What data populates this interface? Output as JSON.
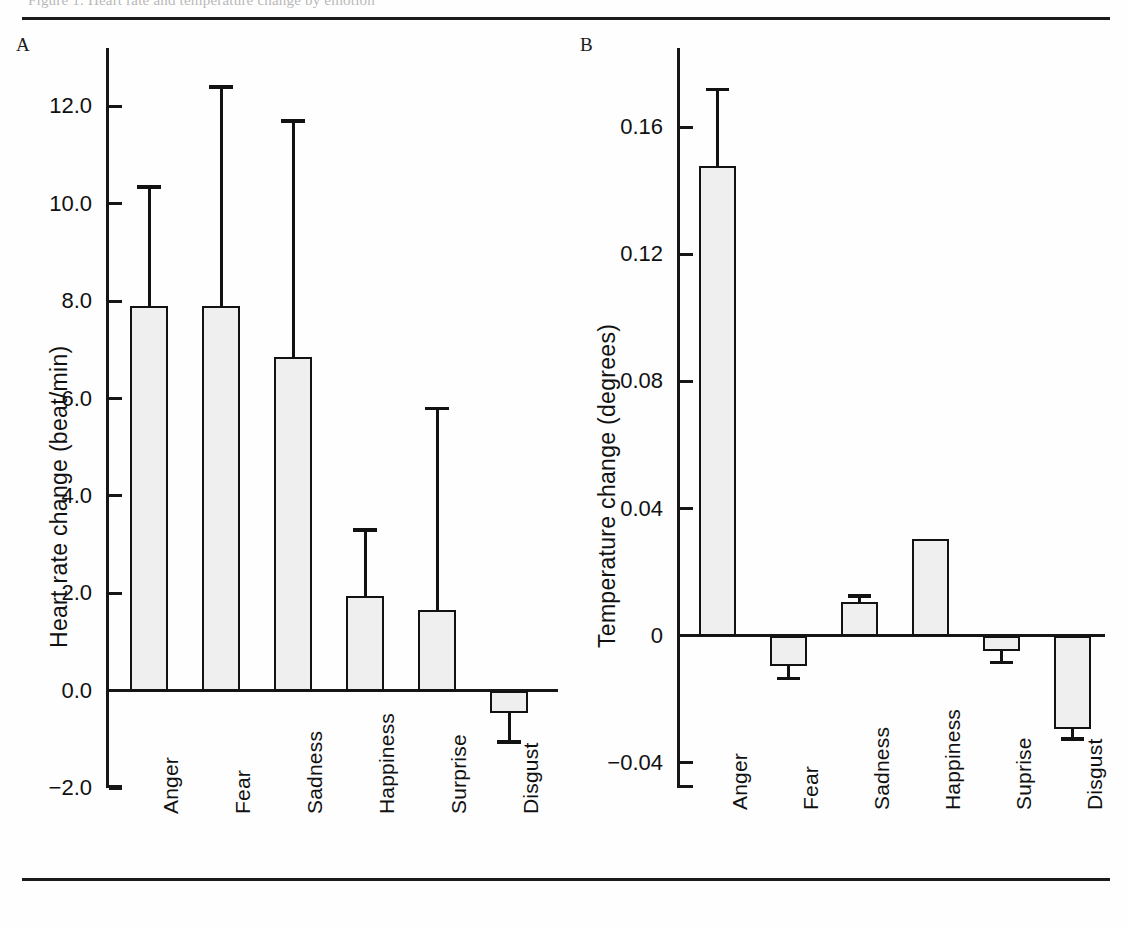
{
  "figure": {
    "caption_sliver": "Figure 1.  Heart rate and temperature change by emotion",
    "panels": [
      {
        "id": "A",
        "letter": "A"
      },
      {
        "id": "B",
        "letter": "B"
      }
    ]
  },
  "chart_data": [
    {
      "panel": "A",
      "type": "bar",
      "title": "",
      "xlabel": "",
      "ylabel": "Heart rate change (beat/min)",
      "ylim": [
        -2.0,
        13.2
      ],
      "yticks": [
        12.0,
        10.0,
        8.0,
        6.0,
        4.0,
        2.0,
        0.0,
        -2.0
      ],
      "ytick_labels": [
        "12.0",
        "10.0",
        "8.0",
        "6.0",
        "4.0",
        "2.0",
        "0.0",
        "−2.0"
      ],
      "grid": false,
      "legend": "none",
      "categories": [
        "Anger",
        "Fear",
        "Sadness",
        "Happiness",
        "Surprise",
        "Disgust"
      ],
      "values": [
        7.9,
        7.9,
        6.85,
        1.95,
        1.65,
        -0.45
      ],
      "errors_upper": [
        10.35,
        12.4,
        11.7,
        3.3,
        5.8,
        0.0
      ],
      "errors_lower": [
        7.9,
        7.9,
        6.85,
        1.95,
        1.65,
        -1.05
      ],
      "error_direction": [
        "up",
        "up",
        "up",
        "up",
        "up",
        "down"
      ]
    },
    {
      "panel": "B",
      "type": "bar",
      "title": "",
      "xlabel": "",
      "ylabel": "Temperature change (degrees)",
      "ylim": [
        -0.048,
        0.185
      ],
      "yticks": [
        0.16,
        0.12,
        0.08,
        0.04,
        0,
        -0.04
      ],
      "ytick_labels": [
        "0.16",
        "0.12",
        "0.08",
        "0.04",
        "0",
        "−0.04"
      ],
      "grid": false,
      "legend": "none",
      "categories": [
        "Anger",
        "Fear",
        "Sadness",
        "Happiness",
        "Suprise",
        "Disgust"
      ],
      "values": [
        0.148,
        -0.0095,
        0.0105,
        0.0305,
        -0.005,
        -0.0295
      ],
      "errors_upper": [
        0.172,
        -0.0095,
        0.0125,
        0.0305,
        -0.005,
        -0.0295
      ],
      "errors_lower": [
        0.148,
        -0.0135,
        0.0105,
        0.0305,
        -0.0085,
        -0.0325
      ],
      "error_direction": [
        "up",
        "down",
        "up",
        "none",
        "down",
        "down"
      ]
    }
  ],
  "panelA": {
    "letter": "A",
    "axis_title": "Heart rate change (beat/min)",
    "ticks": [
      {
        "label": "12.0"
      },
      {
        "label": "10.0"
      },
      {
        "label": "8.0"
      },
      {
        "label": "6.0"
      },
      {
        "label": "4.0"
      },
      {
        "label": "2.0"
      },
      {
        "label": "0.0"
      },
      {
        "label": "−2.0"
      }
    ],
    "xlabels": [
      "Anger",
      "Fear",
      "Sadness",
      "Happiness",
      "Surprise",
      "Disgust"
    ]
  },
  "panelB": {
    "letter": "B",
    "axis_title": "Temperature change (degrees)",
    "ticks": [
      {
        "label": "0.16"
      },
      {
        "label": "0.12"
      },
      {
        "label": "0.08"
      },
      {
        "label": "0.04"
      },
      {
        "label": "0"
      },
      {
        "label": "−0.04"
      }
    ],
    "xlabels": [
      "Anger",
      "Fear",
      "Sadness",
      "Happiness",
      "Suprise",
      "Disgust"
    ]
  },
  "colors": {
    "ink": "#121212",
    "bar_fill": "#efefef",
    "background": "#ffffff"
  }
}
